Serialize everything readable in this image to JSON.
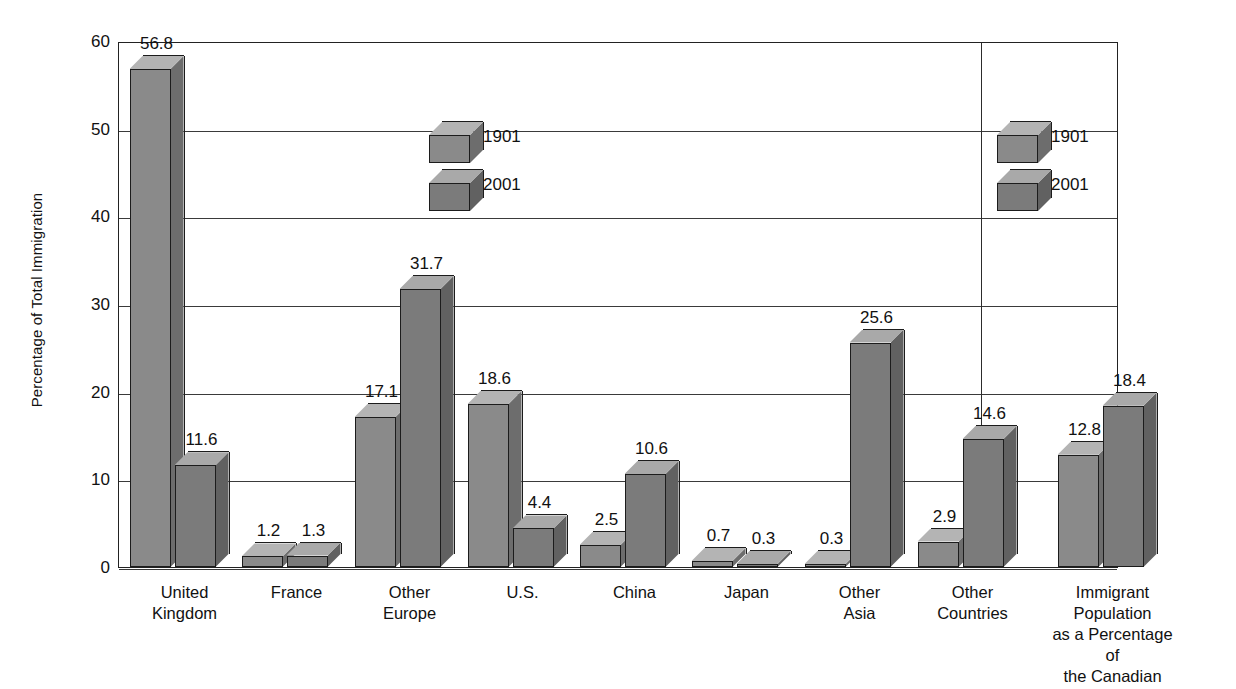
{
  "chart_data": {
    "type": "bar",
    "title": "",
    "xlabel": "",
    "ylabel": "Percentage of Total Immigration",
    "ylim": [
      0,
      60
    ],
    "ytick_values": [
      0,
      10,
      20,
      30,
      40,
      50,
      60
    ],
    "ytick_labels": [
      "0",
      "10",
      "20",
      "30",
      "40",
      "50",
      "60"
    ],
    "grid": true,
    "legend_position": "inside-upper-center",
    "categories": [
      "United\nKingdom",
      "France",
      "Other\nEurope",
      "U.S.",
      "China",
      "Japan",
      "Other\nAsia",
      "Other\nCountries",
      "Immigrant Population\nas a Percentage of\nthe Canadian Population"
    ],
    "series": [
      {
        "name": "1901",
        "values": [
          56.8,
          1.2,
          17.1,
          18.6,
          2.5,
          0.7,
          0.3,
          2.9,
          12.8
        ]
      },
      {
        "name": "2001",
        "values": [
          11.6,
          1.3,
          31.7,
          4.4,
          10.6,
          0.3,
          25.6,
          14.6,
          18.4
        ]
      }
    ],
    "data_labels": [
      [
        "56.8",
        "1.2",
        "17.1",
        "18.6",
        "2.5",
        "0.7",
        "0.3",
        "2.9",
        "12.8"
      ],
      [
        "11.6",
        "1.3",
        "31.7",
        "4.4",
        "10.6",
        "0.3",
        "25.6",
        "14.6",
        "18.4"
      ]
    ],
    "panel_divider_after_category_index": 7
  },
  "legend": {
    "entries": [
      {
        "label": "1901",
        "color": "#8c8c8c"
      },
      {
        "label": "2001",
        "color": "#7a7a7a"
      }
    ]
  },
  "legends": [
    {
      "name": "legend-left",
      "entries": [
        "1901",
        "2001"
      ]
    },
    {
      "name": "legend-right",
      "entries": [
        "1901",
        "2001"
      ]
    }
  ],
  "axis": {
    "y_title": "Percentage of Total Immigration",
    "y_ticks": [
      "60",
      "50",
      "40",
      "30",
      "20",
      "10",
      "0"
    ]
  },
  "colors": {
    "series_1901_front": "#8a8a8a",
    "series_1901_top": "#b4b4b4",
    "series_1901_side": "#6d6d6d",
    "series_2001_front": "#7b7b7b",
    "series_2001_top": "#a9a9a9",
    "series_2001_side": "#616161",
    "outline": "#1c1c1c",
    "grid": "#3a3a3a",
    "frame": "#222222",
    "background": "#ffffff",
    "text": "#111111"
  },
  "cropped_title_fragment": ""
}
